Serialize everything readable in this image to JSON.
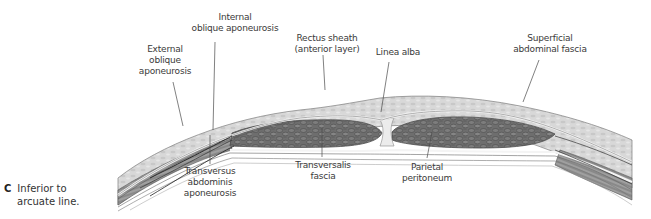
{
  "figure": {
    "panel_letter": "C",
    "caption_line1": "Inferior to",
    "caption_line2": "arcuate line.",
    "colors": {
      "subcutaneous_fat": "#d9d9d9",
      "fat_texture": "#bfbfbf",
      "rectus_muscle": "#6f6f6f",
      "rectus_texture": "#4a4a4a",
      "oblique_muscle": "#8c8c8c",
      "fascia_line": "#f4f4f4",
      "outline": "#5a5a5a",
      "leader_line": "#4a4a4a",
      "label_text": "#3a3a3a"
    }
  },
  "labels": {
    "internal_oblique": [
      "Internal",
      "oblique aponeurosis"
    ],
    "external_oblique": [
      "External",
      "oblique",
      "aponeurosis"
    ],
    "rectus_sheath": [
      "Rectus sheath",
      "(anterior layer)"
    ],
    "linea_alba": [
      "Linea alba"
    ],
    "superficial_fascia": [
      "Superficial",
      "abdominal fascia"
    ],
    "transversus": [
      "Transversus",
      "abdominis",
      "aponeurosis"
    ],
    "transversalis": [
      "Transversalis",
      "fascia"
    ],
    "parietal_peritoneum": [
      "Parietal",
      "peritoneum"
    ]
  }
}
